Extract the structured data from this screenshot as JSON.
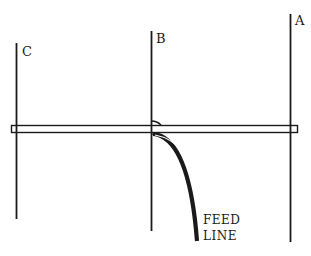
{
  "diagram": {
    "type": "antenna-schematic",
    "elements": [
      {
        "id": "C",
        "label": "C",
        "x": 16,
        "y_top": 43,
        "y_bottom": 219
      },
      {
        "id": "B",
        "label": "B",
        "x": 151,
        "y_top": 31,
        "y_bottom": 231
      },
      {
        "id": "A",
        "label": "A",
        "x": 290,
        "y_top": 14,
        "y_bottom": 242
      }
    ],
    "boom": {
      "x1": 11,
      "x2": 297,
      "y_top": 125,
      "y_bottom": 133
    },
    "feed_line": {
      "label_line1": "FEED",
      "label_line2": "LINE"
    },
    "colors": {
      "stroke": "#1a1a1a",
      "background": "#ffffff"
    }
  }
}
